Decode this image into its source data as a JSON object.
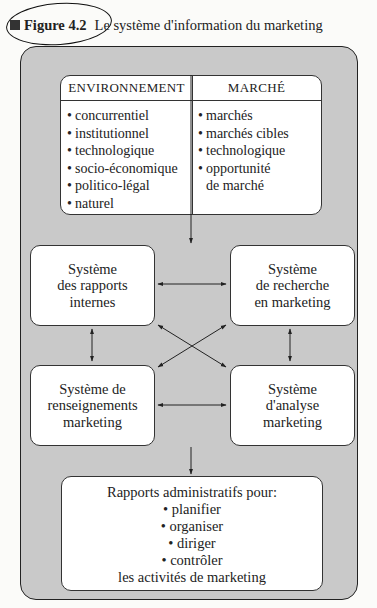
{
  "caption": {
    "marker_icon": "filled-square",
    "figure_label": "Figure 4.2",
    "title": "Le système d'information du marketing"
  },
  "top_box": {
    "left": {
      "header": "ENVIRONNEMENT",
      "items": [
        "concurrentiel",
        "institutionnel",
        "technologique",
        "socio-économique",
        "politico-légal",
        "naturel"
      ]
    },
    "right": {
      "header": "MARCHÉ",
      "items": [
        "marchés",
        "marchés cibles",
        "technologique",
        "opportunité"
      ],
      "continuation": "de marché"
    }
  },
  "systems": {
    "internal_reports": [
      "Système",
      "des rapports",
      "internes"
    ],
    "marketing_research": [
      "Système",
      "de recherche",
      "en marketing"
    ],
    "marketing_intelligence": [
      "Système de",
      "renseignements",
      "marketing"
    ],
    "marketing_analysis": [
      "Système",
      "d'analyse",
      "marketing"
    ]
  },
  "bottom_box": {
    "heading": "Rapports administratifs pour:",
    "items": [
      "planifier",
      "organiser",
      "diriger",
      "contrôler"
    ],
    "footer": "les activités de marketing"
  },
  "bullet": "•",
  "colors": {
    "frame_fill": "#c9c9c9",
    "box_fill": "#ffffff",
    "line": "#222222"
  }
}
